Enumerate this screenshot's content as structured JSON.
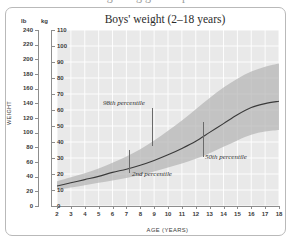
{
  "page": {
    "cutoff_text": "recognising growth problems"
  },
  "chart_data": {
    "type": "area",
    "title": "Boys' weight (2–18 years)",
    "xlabel": "AGE (YEARS)",
    "ylabel": "WEIGHT",
    "unit_left": "lb",
    "unit_right": "kg",
    "xlim": [
      2,
      18
    ],
    "ylim_kg": [
      0,
      110
    ],
    "ylim_lb": [
      0,
      240
    ],
    "grid": true,
    "legend": "none",
    "x_ticks": [
      2,
      3,
      4,
      5,
      6,
      7,
      8,
      9,
      10,
      11,
      12,
      13,
      14,
      15,
      16,
      17,
      18
    ],
    "y_ticks_kg": [
      0,
      10,
      20,
      30,
      40,
      50,
      60,
      70,
      80,
      90,
      100,
      110
    ],
    "y_ticks_lb": [
      0,
      20,
      40,
      60,
      80,
      100,
      120,
      140,
      160,
      180,
      200,
      220,
      240
    ],
    "x": [
      2,
      3,
      4,
      5,
      6,
      7,
      8,
      9,
      10,
      11,
      12,
      13,
      14,
      15,
      16,
      17,
      18
    ],
    "series": [
      {
        "name": "98th percentile",
        "unit": "kg",
        "values": [
          15.5,
          18.0,
          20.5,
          23.5,
          27.0,
          31.0,
          35.5,
          41.0,
          47.0,
          53.5,
          60.5,
          67.5,
          74.0,
          79.5,
          84.0,
          87.0,
          89.0
        ]
      },
      {
        "name": "50th percentile",
        "unit": "kg",
        "values": [
          12.5,
          14.5,
          16.5,
          18.5,
          21.0,
          23.0,
          25.5,
          28.5,
          32.0,
          36.0,
          40.5,
          46.0,
          51.5,
          57.0,
          61.5,
          64.0,
          65.5
        ]
      },
      {
        "name": "2nd percentile",
        "unit": "kg",
        "values": [
          10.0,
          11.5,
          13.0,
          14.5,
          16.0,
          17.5,
          19.5,
          21.5,
          24.0,
          26.5,
          29.5,
          33.0,
          37.0,
          41.0,
          44.5,
          46.5,
          47.5
        ]
      }
    ],
    "annotations": [
      {
        "text": "98th percentile",
        "x": 9.8,
        "y_kg": 62
      },
      {
        "text": "2nd percentile",
        "x": 8.4,
        "y_kg": 16
      },
      {
        "text": "50th percentile",
        "x": 13.5,
        "y_kg": 30
      }
    ],
    "colors": {
      "plot_background": "#e9e9e9",
      "grid": "#ffffff",
      "band": "#b4b4b4",
      "median_line": "#3a3a3a",
      "axis": "#8d8d8d",
      "text": "#2f2f2f"
    }
  }
}
